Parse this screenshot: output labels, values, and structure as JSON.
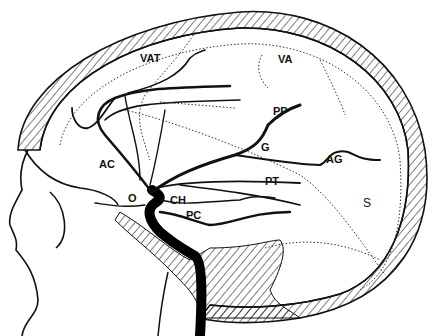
{
  "figure": {
    "type": "anatomical line drawing",
    "colors": {
      "ink": "#111111",
      "background": "#ffffff"
    },
    "labels": [
      {
        "id": "vat",
        "text": "VAT",
        "x": 140,
        "y": 62
      },
      {
        "id": "va",
        "text": "VA",
        "x": 278,
        "y": 63
      },
      {
        "id": "pp",
        "text": "PP",
        "x": 273,
        "y": 115
      },
      {
        "id": "g",
        "text": "G",
        "x": 261,
        "y": 151
      },
      {
        "id": "ag",
        "text": "AG",
        "x": 326,
        "y": 163
      },
      {
        "id": "pt",
        "text": "PT",
        "x": 265,
        "y": 185
      },
      {
        "id": "ac",
        "text": "AC",
        "x": 99,
        "y": 168
      },
      {
        "id": "o",
        "text": "O",
        "x": 128,
        "y": 202
      },
      {
        "id": "ch",
        "text": "CH",
        "x": 170,
        "y": 204
      },
      {
        "id": "pc",
        "text": "PC",
        "x": 186,
        "y": 219
      },
      {
        "id": "s",
        "text": "S",
        "x": 363,
        "y": 207
      }
    ]
  }
}
